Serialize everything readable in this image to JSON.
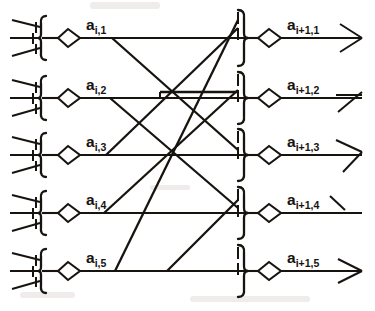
{
  "figure": {
    "type": "neural-network-layer-diagram",
    "ink_color": "#17130f",
    "background_color": "#ffffff",
    "rows": 5,
    "left_labels": [
      {
        "base": "a",
        "sub": "i,1"
      },
      {
        "base": "a",
        "sub": "i,2"
      },
      {
        "base": "a",
        "sub": "i,3"
      },
      {
        "base": "a",
        "sub": "i,4"
      },
      {
        "base": "a",
        "sub": "i,5"
      }
    ],
    "right_labels": [
      {
        "base": "a",
        "sub": "i+1,1"
      },
      {
        "base": "a",
        "sub": "i+1,2"
      },
      {
        "base": "a",
        "sub": "i+1,3"
      },
      {
        "base": "a",
        "sub": "i+1,4"
      },
      {
        "base": "a",
        "sub": "i+1,5"
      }
    ],
    "row_y": [
      38,
      98,
      155,
      213,
      271
    ],
    "left_neuron": {
      "dendrite_count": 3,
      "soma_shape": "diamond",
      "trunk_x": 42,
      "soma_x": 68
    },
    "right_neuron": {
      "soma_shape": "diamond",
      "trunk_x": 243,
      "soma_x": 270,
      "axon_terminal": "fan"
    },
    "connections": [
      {
        "from": 1,
        "to": 1
      },
      {
        "from": 1,
        "to": 3
      },
      {
        "from": 2,
        "to": 2
      },
      {
        "from": 2,
        "to": 4
      },
      {
        "from": 3,
        "to": 3
      },
      {
        "from": 3,
        "to": 1
      },
      {
        "from": 4,
        "to": 4
      },
      {
        "from": 4,
        "to": 2
      },
      {
        "from": 5,
        "to": 5
      },
      {
        "from": 5,
        "to": 1
      },
      {
        "from": 5,
        "to": 3
      }
    ]
  }
}
